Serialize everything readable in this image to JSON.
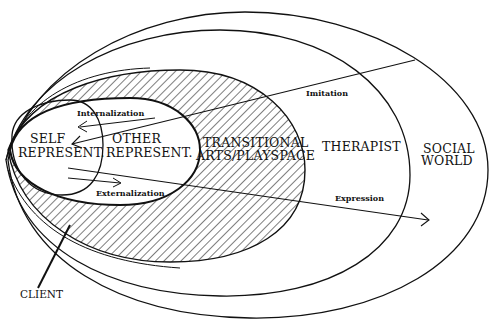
{
  "diagram": {
    "regions": {
      "self": [
        "SELF",
        "REPRESENT."
      ],
      "other": [
        "OTHER",
        "REPRESENT."
      ],
      "transitional": [
        "TRANSITIONAL",
        "ARTS/PLAYSPACE"
      ],
      "therapist": "THERAPIST",
      "social": [
        "SOCIAL",
        "WORLD"
      ]
    },
    "arrows": {
      "internalization": "Internalization",
      "externalization": "Externalization",
      "imitation": "Imitation",
      "expression": "Expression"
    },
    "pointer_label": "CLIENT",
    "colors": {
      "ink": "#111111",
      "background": "#ffffff"
    }
  }
}
